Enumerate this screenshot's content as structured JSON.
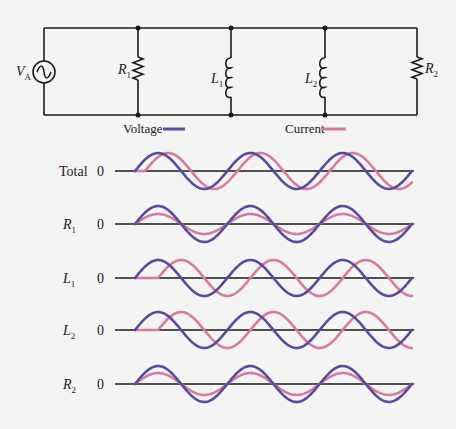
{
  "circuit": {
    "source": {
      "label": "V",
      "subscript": "A",
      "x": 44,
      "cy": 72,
      "r": 11
    },
    "top_wire_y": 28,
    "bottom_wire_y": 115,
    "left_x": 44,
    "right_x": 417,
    "components": [
      {
        "id": "R1",
        "type": "resistor",
        "label": "R",
        "subscript": "1",
        "x": 138,
        "y1": 57,
        "y2": 80,
        "label_side": "left"
      },
      {
        "id": "L1",
        "type": "inductor",
        "label": "L",
        "subscript": "1",
        "x": 231,
        "y1": 58,
        "y2": 97,
        "label_side": "left"
      },
      {
        "id": "L2",
        "type": "inductor",
        "label": "L",
        "subscript": "2",
        "x": 325,
        "y1": 58,
        "y2": 97,
        "label_side": "left"
      },
      {
        "id": "R2",
        "type": "resistor",
        "label": "R",
        "subscript": "2",
        "x": 417,
        "y1": 57,
        "y2": 79,
        "label_side": "right"
      }
    ],
    "junctions_x": [
      138,
      231,
      325
    ]
  },
  "legend": {
    "voltage": {
      "label": "Voltage",
      "color": "#5a4b9a"
    },
    "current": {
      "label": "Current",
      "color": "#d77aa0"
    }
  },
  "chart_data": {
    "type": "line",
    "title": "",
    "xlabel": "",
    "ylabel": "",
    "x_start": 135,
    "x_end": 412,
    "axis_x_start": 115,
    "axis_x_end": 414,
    "cycles": 3,
    "zero_label": "0",
    "rows": [
      {
        "name": "Total",
        "subscript": "",
        "italic": false,
        "axis_y": 171,
        "series": [
          {
            "name": "Voltage",
            "amplitude": 18,
            "phase_deg": 0
          },
          {
            "name": "Current",
            "amplitude": 18,
            "phase_deg": -39
          }
        ]
      },
      {
        "name": "R",
        "subscript": "1",
        "italic": true,
        "axis_y": 224,
        "series": [
          {
            "name": "Voltage",
            "amplitude": 18,
            "phase_deg": 0
          },
          {
            "name": "Current",
            "amplitude": 10,
            "phase_deg": 0
          }
        ]
      },
      {
        "name": "L",
        "subscript": "1",
        "italic": true,
        "axis_y": 278,
        "series": [
          {
            "name": "Voltage",
            "amplitude": 18,
            "phase_deg": 0
          },
          {
            "name": "Current",
            "amplitude": 18,
            "phase_deg": -90
          }
        ]
      },
      {
        "name": "L",
        "subscript": "2",
        "italic": true,
        "axis_y": 330,
        "series": [
          {
            "name": "Voltage",
            "amplitude": 18,
            "phase_deg": 0
          },
          {
            "name": "Current",
            "amplitude": 18,
            "phase_deg": -90
          }
        ]
      },
      {
        "name": "R",
        "subscript": "2",
        "italic": true,
        "axis_y": 384,
        "series": [
          {
            "name": "Voltage",
            "amplitude": 18,
            "phase_deg": 0
          },
          {
            "name": "Current",
            "amplitude": 11,
            "phase_deg": 0
          }
        ]
      }
    ]
  }
}
